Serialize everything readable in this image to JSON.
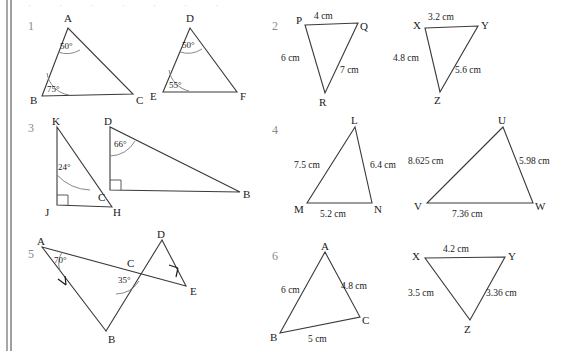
{
  "page": {
    "width": 569,
    "height": 351,
    "background": "#ffffff",
    "binding_color": "#b9b9b9",
    "ink_color": "#1a1a1a",
    "number_color": "#8a8a8a",
    "top_cut_text": "· · · · · · ·"
  },
  "problems": [
    {
      "number": "1",
      "figures": [
        {
          "name": "triangle-abc",
          "vertices": [
            {
              "label": "A",
              "x": 68,
              "y": 28,
              "lx": 64,
              "ly": 22
            },
            {
              "label": "B",
              "x": 42,
              "y": 96,
              "lx": 30,
              "ly": 103
            },
            {
              "label": "C",
              "x": 133,
              "y": 94,
              "lx": 136,
              "ly": 103
            }
          ],
          "angles": [
            {
              "at": "A",
              "value": "50°",
              "lx": 63,
              "ly": 45
            },
            {
              "at": "B",
              "value": "75°",
              "lx": 47,
              "ly": 91
            }
          ]
        },
        {
          "name": "triangle-def",
          "vertices": [
            {
              "label": "D",
              "x": 190,
              "y": 28,
              "lx": 186,
              "ly": 22
            },
            {
              "label": "E",
              "x": 163,
              "y": 92,
              "lx": 150,
              "ly": 99
            },
            {
              "label": "F",
              "x": 237,
              "y": 92,
              "lx": 240,
              "ly": 99
            }
          ],
          "angles": [
            {
              "at": "D",
              "value": "50°",
              "lx": 185,
              "ly": 45
            },
            {
              "at": "E",
              "value": "55°",
              "lx": 170,
              "ly": 87
            }
          ]
        }
      ]
    },
    {
      "number": "2",
      "figures": [
        {
          "name": "triangle-pqr",
          "vertices": [
            {
              "label": "P",
              "x": 305,
              "y": 25,
              "lx": 296,
              "ly": 22
            },
            {
              "label": "Q",
              "x": 358,
              "y": 23,
              "lx": 361,
              "ly": 27
            },
            {
              "label": "R",
              "x": 325,
              "y": 93,
              "lx": 320,
              "ly": 104
            }
          ],
          "measures": [
            {
              "side": "PQ",
              "value": "4 cm",
              "lx": 318,
              "ly": 18
            },
            {
              "side": "PR",
              "value": "6 cm",
              "lx": 283,
              "ly": 58
            },
            {
              "side": "QR",
              "value": "7 cm",
              "lx": 344,
              "ly": 70
            }
          ]
        },
        {
          "name": "triangle-xyz",
          "vertices": [
            {
              "label": "X",
              "x": 425,
              "y": 28,
              "lx": 414,
              "ly": 26
            },
            {
              "label": "Y",
              "x": 478,
              "y": 26,
              "lx": 481,
              "ly": 25
            },
            {
              "label": "Z",
              "x": 440,
              "y": 92,
              "lx": 435,
              "ly": 103
            }
          ],
          "measures": [
            {
              "side": "XY",
              "value": "3.2 cm",
              "lx": 432,
              "ly": 18
            },
            {
              "side": "XZ",
              "value": "4.8 cm",
              "lx": 397,
              "ly": 58
            },
            {
              "side": "YZ",
              "value": "5.6 cm",
              "lx": 460,
              "ly": 70
            }
          ]
        }
      ]
    },
    {
      "number": "3",
      "figures": [
        {
          "name": "triangle-jkh",
          "vertices": [
            {
              "label": "K",
              "x": 57,
              "y": 127,
              "lx": 52,
              "ly": 123
            },
            {
              "label": "J",
              "x": 57,
              "y": 205,
              "lx": 46,
              "ly": 214
            },
            {
              "label": "H",
              "x": 112,
              "y": 207,
              "lx": 114,
              "ly": 214
            }
          ],
          "angles": [
            {
              "at": "K",
              "value": "24°",
              "lx": 60,
              "ly": 167
            }
          ],
          "right_angle_at": "J"
        },
        {
          "name": "triangle-cdb",
          "vertices": [
            {
              "label": "D",
              "x": 110,
              "y": 127,
              "lx": 105,
              "ly": 123
            },
            {
              "label": "C",
              "x": 110,
              "y": 190,
              "lx": 99,
              "ly": 199
            },
            {
              "label": "B",
              "x": 240,
              "y": 192,
              "lx": 243,
              "ly": 198
            }
          ],
          "angles": [
            {
              "at": "D",
              "value": "66°",
              "lx": 116,
              "ly": 146
            }
          ],
          "right_angle_at": "C"
        }
      ]
    },
    {
      "number": "4",
      "figures": [
        {
          "name": "triangle-lmn",
          "vertices": [
            {
              "label": "L",
              "x": 355,
              "y": 127,
              "lx": 351,
              "ly": 123
            },
            {
              "label": "M",
              "x": 307,
              "y": 203,
              "lx": 295,
              "ly": 211
            },
            {
              "label": "N",
              "x": 372,
              "y": 203,
              "lx": 375,
              "ly": 211
            }
          ],
          "measures": [
            {
              "side": "LM",
              "value": "7.5 cm",
              "lx": 296,
              "ly": 165
            },
            {
              "side": "LN",
              "value": "6.4 cm",
              "lx": 374,
              "ly": 165
            },
            {
              "side": "MN",
              "value": "5.2 cm",
              "lx": 323,
              "ly": 215
            }
          ]
        },
        {
          "name": "triangle-uvw",
          "vertices": [
            {
              "label": "U",
              "x": 503,
              "y": 127,
              "lx": 498,
              "ly": 123
            },
            {
              "label": "V",
              "x": 427,
              "y": 203,
              "lx": 414,
              "ly": 208
            },
            {
              "label": "W",
              "x": 533,
              "y": 203,
              "lx": 536,
              "ly": 208
            }
          ],
          "measures": [
            {
              "side": "UV",
              "value": "8.625 cm",
              "lx": 412,
              "ly": 162
            },
            {
              "side": "UW",
              "value": "5.98 cm",
              "lx": 524,
              "ly": 162
            },
            {
              "side": "VW",
              "value": "7.36 cm",
              "lx": 456,
              "ly": 215
            }
          ]
        }
      ]
    },
    {
      "number": "5",
      "figures": [
        {
          "name": "crossed-triangles-abc-cde",
          "vertices": [
            {
              "label": "A",
              "x": 42,
              "y": 247,
              "lx": 38,
              "ly": 243
            },
            {
              "label": "B",
              "x": 106,
              "y": 331,
              "lx": 108,
              "ly": 341
            },
            {
              "label": "C",
              "x": 133,
              "y": 269,
              "lx": 128,
              "ly": 265
            },
            {
              "label": "D",
              "x": 162,
              "y": 240,
              "lx": 158,
              "ly": 236
            },
            {
              "label": "E",
              "x": 186,
              "y": 286,
              "lx": 190,
              "ly": 292
            }
          ],
          "angles": [
            {
              "at": "A",
              "value": "70°",
              "lx": 56,
              "ly": 262
            },
            {
              "at": "C",
              "value": "35°",
              "lx": 120,
              "ly": 280
            }
          ],
          "tick_marks": [
            "AB",
            "DE"
          ]
        }
      ]
    },
    {
      "number": "6",
      "figures": [
        {
          "name": "triangle-abc-6",
          "vertices": [
            {
              "label": "A",
              "x": 325,
              "y": 252,
              "lx": 321,
              "ly": 248
            },
            {
              "label": "B",
              "x": 280,
              "y": 333,
              "lx": 271,
              "ly": 339
            },
            {
              "label": "C",
              "x": 360,
              "y": 317,
              "lx": 363,
              "ly": 322
            },
            {
              "label": "A",
              "x": 325,
              "y": 252,
              "lx": 321,
              "ly": 248
            }
          ],
          "measures": [
            {
              "side": "AB",
              "value": "6 cm",
              "lx": 286,
              "ly": 290
            },
            {
              "side": "AC",
              "value": "4.8 cm",
              "lx": 348,
              "ly": 286
            },
            {
              "side": "BC",
              "value": "5 cm",
              "lx": 312,
              "ly": 338
            }
          ]
        },
        {
          "name": "triangle-xyz-6",
          "vertices": [
            {
              "label": "X",
              "x": 425,
              "y": 258,
              "lx": 413,
              "ly": 256
            },
            {
              "label": "Y",
              "x": 505,
              "y": 257,
              "lx": 508,
              "ly": 256
            },
            {
              "label": "Z",
              "x": 470,
              "y": 320,
              "lx": 465,
              "ly": 331
            }
          ],
          "measures": [
            {
              "side": "XY",
              "value": "4.2 cm",
              "lx": 447,
              "ly": 250
            },
            {
              "side": "XZ",
              "value": "3.5 cm",
              "lx": 412,
              "ly": 293
            },
            {
              "side": "YZ",
              "value": "3.36 cm",
              "lx": 490,
              "ly": 293
            }
          ]
        }
      ]
    }
  ],
  "question_numbers": [
    {
      "label": "1",
      "x": 28,
      "y": 26
    },
    {
      "label": "2",
      "x": 272,
      "y": 26
    },
    {
      "label": "3",
      "x": 28,
      "y": 128
    },
    {
      "label": "4",
      "x": 272,
      "y": 130
    },
    {
      "label": "5",
      "x": 28,
      "y": 254
    },
    {
      "label": "6",
      "x": 272,
      "y": 256
    }
  ]
}
